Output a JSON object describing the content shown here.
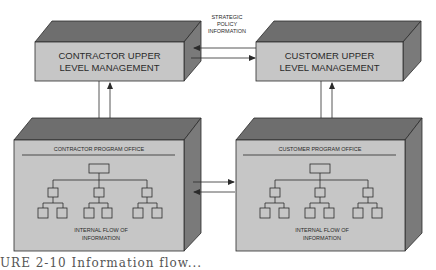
{
  "diagram": {
    "colors": {
      "front_face": "#c6c6c6",
      "top_face": "#6e6e6e",
      "side_face": "#7a7a7a",
      "stroke": "#2b2b2b",
      "text": "#2a2a2a"
    },
    "nodes": {
      "contractor_upper": {
        "line1": "CONTRACTOR UPPER",
        "line2": "LEVEL MANAGEMENT"
      },
      "customer_upper": {
        "line1": "CUSTOMER UPPER",
        "line2": "LEVEL MANAGEMENT"
      },
      "contractor_office": {
        "title": "CONTRACTOR PROGRAM OFFICE",
        "flow_line1": "INTERNAL FLOW OF",
        "flow_line2": "INFORMATION"
      },
      "customer_office": {
        "title": "CUSTOMER PROGRAM OFFICE",
        "flow_line1": "INTERNAL FLOW OF",
        "flow_line2": "INFORMATION"
      }
    },
    "edges": [
      {
        "from": "customer_upper",
        "to": "contractor_upper",
        "label": "strategic policy information"
      },
      {
        "from": "contractor_upper",
        "to": "customer_upper",
        "label": "strategic policy information"
      },
      {
        "from": "contractor_upper",
        "to": "contractor_office"
      },
      {
        "from": "contractor_office",
        "to": "contractor_upper"
      },
      {
        "from": "customer_upper",
        "to": "customer_office"
      },
      {
        "from": "customer_office",
        "to": "customer_upper"
      },
      {
        "from": "contractor_office",
        "to": "customer_office"
      },
      {
        "from": "customer_office",
        "to": "contractor_office"
      }
    ],
    "edge_label": {
      "line1": "STRATEGIC",
      "line2": "POLICY",
      "line3": "INFORMATION"
    },
    "caption_partial": "URE 2-10   Information flow..."
  }
}
